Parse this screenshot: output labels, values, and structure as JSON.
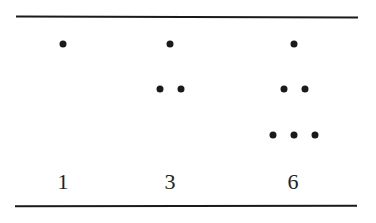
{
  "figure": {
    "columns": [
      {
        "label": "1",
        "rows": [
          1
        ]
      },
      {
        "label": "3",
        "rows": [
          1,
          2
        ]
      },
      {
        "label": "6",
        "rows": [
          1,
          2,
          3
        ]
      }
    ],
    "colors": {
      "ink": "#1a1a1a",
      "background": "#ffffff"
    }
  }
}
